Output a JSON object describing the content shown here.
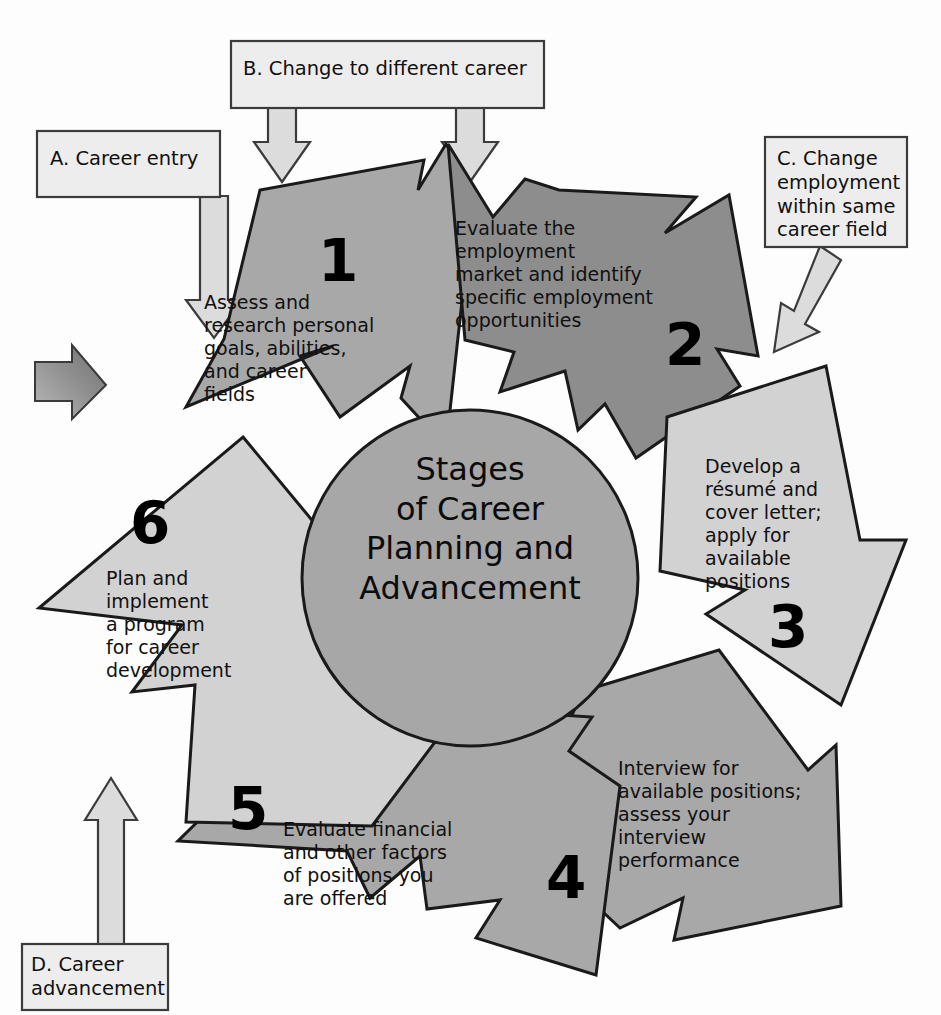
{
  "diagram": {
    "title": "Stages of Career Planning and Advancement",
    "type": "cycle-diagram",
    "center": {
      "line1": "Stages",
      "line2": "of Career",
      "line3": "Planning and",
      "line4": "Advancement",
      "fill": "#a7a7a7"
    },
    "colors": {
      "arrow_medium": "#a8a8a8",
      "arrow_dark": "#8d8d8d",
      "arrow_light": "#d2d2d2",
      "callout_fill": "#ededed",
      "callout_arrow_fill": "#dcdcdc",
      "outline": "#1a1a1a",
      "entry_chevron": "#8a8a8a",
      "background": "#ffffff"
    },
    "steps": [
      {
        "number": "1",
        "text_lines": [
          "Assess and",
          "research personal",
          "goals, abilities,",
          "and career",
          "fields"
        ],
        "text": "Assess and research personal goals, abilities, and career fields",
        "shade": "medium"
      },
      {
        "number": "2",
        "text_lines": [
          "Evaluate the",
          "employment",
          "market and identify",
          "specific employment",
          "opportunities"
        ],
        "text": "Evaluate the employment market and identify specific employment opportunities",
        "shade": "dark"
      },
      {
        "number": "3",
        "text_lines": [
          "Develop a",
          "résumé and",
          "cover letter;",
          "apply for",
          "available",
          "positions"
        ],
        "text": "Develop a résumé and cover letter; apply for available positions",
        "shade": "light"
      },
      {
        "number": "4",
        "text_lines": [
          "Interview for",
          "available positions;",
          "assess your",
          "interview",
          "performance"
        ],
        "text": "Interview for available positions; assess your interview performance",
        "shade": "medium"
      },
      {
        "number": "5",
        "text_lines": [
          "Evaluate financial",
          "and other factors",
          "of positions you",
          "are offered"
        ],
        "text": "Evaluate financial and other factors of positions you are offered",
        "shade": "medium"
      },
      {
        "number": "6",
        "text_lines": [
          "Plan and",
          "implement",
          "a program",
          "for career",
          "development"
        ],
        "text": "Plan and implement a program for career development",
        "shade": "light"
      }
    ],
    "callouts": [
      {
        "id": "A",
        "label": "A. Career entry",
        "lines": [
          "A. Career entry"
        ],
        "points_to": "step-1"
      },
      {
        "id": "B",
        "label": "B. Change to different career",
        "lines": [
          "B. Change to different career"
        ],
        "points_to": "step-1-and-step-2"
      },
      {
        "id": "C",
        "label": "C. Change employment within same career field",
        "lines": [
          "C. Change",
          "employment",
          "within same",
          "career field"
        ],
        "points_to": "step-3"
      },
      {
        "id": "D",
        "label": "D. Career advancement",
        "lines": [
          "D. Career",
          "advancement"
        ],
        "points_to": "step-6"
      }
    ],
    "entry_marker": {
      "name": "entry-chevron",
      "description": "small shaded right-pointing chevron at left edge"
    }
  }
}
